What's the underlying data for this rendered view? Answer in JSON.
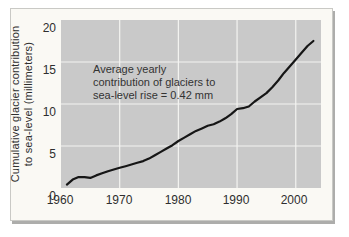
{
  "chart_data": {
    "type": "line",
    "title": "",
    "xlabel": "",
    "ylabel": "Cumulative glacier contribution to sea-level (millimeters)",
    "ylabel_lines": [
      "Cumulative glacier contribution",
      "to sea-level (millimeters)"
    ],
    "annotation_lines": [
      "Average yearly",
      "contribution of glaciers to",
      "sea-level rise = 0.42 mm"
    ],
    "xlim": [
      1960,
      2004.3
    ],
    "ylim": [
      0,
      20
    ],
    "xticks": [
      1960,
      1970,
      1980,
      1990,
      2000
    ],
    "xtick_labels": [
      "1960",
      "1970",
      "1980",
      "1990",
      "2000"
    ],
    "yticks": [
      0,
      5,
      10,
      15,
      20
    ],
    "ytick_labels": [
      "0",
      "5",
      "10",
      "15",
      "20"
    ],
    "grid": true,
    "x_gridlines": [
      1970,
      1980,
      1990,
      2000
    ],
    "y_gridlines": [
      5,
      10,
      15
    ],
    "legend": "none",
    "series": [
      {
        "name": "Cumulative glacier contribution to sea-level rise (mm)",
        "x": [
          1961,
          1962,
          1963,
          1964,
          1965,
          1966,
          1967,
          1968,
          1969,
          1970,
          1971,
          1972,
          1973,
          1974,
          1975,
          1976,
          1977,
          1978,
          1979,
          1980,
          1981,
          1982,
          1983,
          1984,
          1985,
          1986,
          1987,
          1988,
          1989,
          1990,
          1991,
          1992,
          1993,
          1994,
          1995,
          1996,
          1997,
          1998,
          1999,
          2000,
          2001,
          2002,
          2003
        ],
        "y": [
          0.4,
          1.0,
          1.3,
          1.3,
          1.2,
          1.5,
          1.75,
          2.0,
          2.2,
          2.4,
          2.6,
          2.8,
          3.0,
          3.2,
          3.5,
          3.9,
          4.3,
          4.7,
          5.1,
          5.6,
          6.0,
          6.4,
          6.8,
          7.1,
          7.4,
          7.6,
          7.9,
          8.3,
          8.8,
          9.4,
          9.5,
          9.7,
          10.3,
          10.8,
          11.3,
          12.0,
          12.8,
          13.7,
          14.5,
          15.3,
          16.1,
          16.9,
          17.5
        ]
      }
    ],
    "colors": {
      "line": "#161616",
      "plot_bg": "#c9c9c9",
      "grid": "#f4f4f1",
      "card_bg": "#faf9f4",
      "text": "#2e2e2e"
    }
  }
}
